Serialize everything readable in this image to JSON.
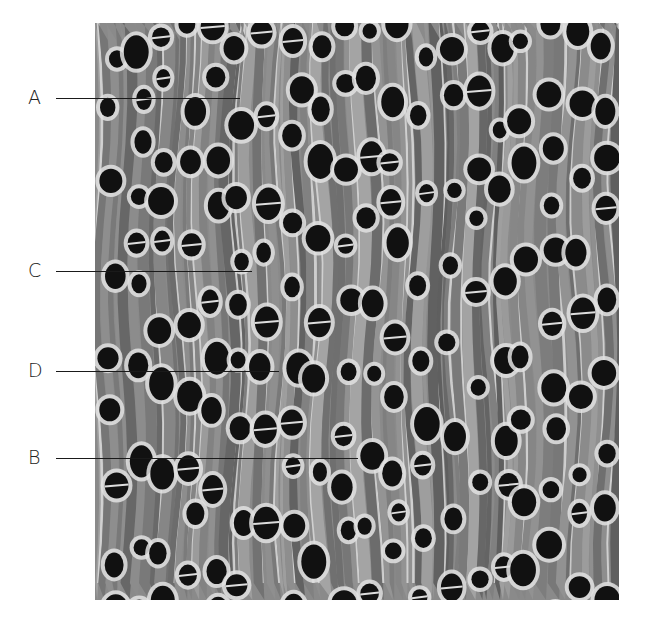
{
  "figure": {
    "image_bounds": {
      "x": 95,
      "y": 23,
      "width": 524,
      "height": 577
    },
    "labels": [
      {
        "id": "A",
        "text": "A",
        "label_x": 28,
        "y": 98,
        "line_start": 56,
        "line_end": 240
      },
      {
        "id": "C",
        "text": "C",
        "label_x": 28,
        "y": 271,
        "line_start": 56,
        "line_end": 252
      },
      {
        "id": "D",
        "text": "D",
        "label_x": 28,
        "y": 371,
        "line_start": 56,
        "line_end": 279
      },
      {
        "id": "B",
        "text": "B",
        "label_x": 28,
        "y": 458,
        "line_start": 56,
        "line_end": 358
      }
    ],
    "colors": {
      "background": "#ffffff",
      "tissue_mid": "#8c8c8c",
      "ray_light": "#d8d8d8",
      "vessel_dark": "#111111",
      "leader_line": "#1a1a1a",
      "label_text": "#222222"
    }
  }
}
